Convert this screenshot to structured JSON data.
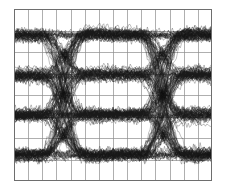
{
  "figure": {
    "width": 228,
    "height": 192,
    "background_color": "#ffffff"
  },
  "plot_area": {
    "left": 14,
    "top": 9,
    "width": 198,
    "height": 172,
    "background_color": "#ffffff",
    "border_color": "#6e6e6e",
    "border_width": 1
  },
  "chart_data": {
    "type": "line",
    "subtype": "eye-diagram",
    "title": "",
    "subtitle": "",
    "xlabel": "",
    "ylabel": "",
    "modulation": "PAM-4",
    "level_count": 4,
    "eye_count_vertical": 3,
    "unit_intervals_shown": 2,
    "xlim": [
      0,
      2
    ],
    "ylim": [
      -0.22,
      1.22
    ],
    "x_tick_labels": [],
    "y_tick_labels": [],
    "grid": {
      "visible": true,
      "color": "#8c8c8c",
      "line_width": 0.7,
      "vertical_divisions": 14,
      "horizontal_divisions": 8
    },
    "signal_levels": {
      "normalized": [
        0,
        0.3333,
        0.6667,
        1
      ],
      "pixel_y": [
        157,
        113,
        73,
        33
      ]
    },
    "crossing_points_x_pixel": [
      75,
      178
    ],
    "crossing_points_x_ui": [
      0.5,
      1.5
    ],
    "trace": {
      "color": "#1a1a1a",
      "line_width": 0.55,
      "opacity": 0.5,
      "sweep_count": 230,
      "samples_per_sweep": 150,
      "persistence": true
    },
    "impairments": {
      "jitter_rms_ui": 0.026,
      "amplitude_noise_rms": 0.016,
      "rise_time_ui": 0.42,
      "rise_time_spread_ui": 0.1,
      "overshoot": 0.035,
      "level_spread": 0.022
    },
    "series": [
      {
        "name": "transition-0-to-0",
        "from_level": 0,
        "to_level": 0
      },
      {
        "name": "transition-0-to-1",
        "from_level": 0,
        "to_level": 1
      },
      {
        "name": "transition-0-to-2",
        "from_level": 0,
        "to_level": 2
      },
      {
        "name": "transition-0-to-3",
        "from_level": 0,
        "to_level": 3
      },
      {
        "name": "transition-1-to-0",
        "from_level": 1,
        "to_level": 0
      },
      {
        "name": "transition-1-to-1",
        "from_level": 1,
        "to_level": 1
      },
      {
        "name": "transition-1-to-2",
        "from_level": 1,
        "to_level": 2
      },
      {
        "name": "transition-1-to-3",
        "from_level": 1,
        "to_level": 3
      },
      {
        "name": "transition-2-to-0",
        "from_level": 2,
        "to_level": 0
      },
      {
        "name": "transition-2-to-1",
        "from_level": 2,
        "to_level": 1
      },
      {
        "name": "transition-2-to-2",
        "from_level": 2,
        "to_level": 2
      },
      {
        "name": "transition-2-to-3",
        "from_level": 2,
        "to_level": 3
      },
      {
        "name": "transition-3-to-0",
        "from_level": 3,
        "to_level": 0
      },
      {
        "name": "transition-3-to-1",
        "from_level": 3,
        "to_level": 1
      },
      {
        "name": "transition-3-to-2",
        "from_level": 3,
        "to_level": 2
      },
      {
        "name": "transition-3-to-3",
        "from_level": 3,
        "to_level": 3
      }
    ],
    "legend": {
      "visible": false,
      "position": "none",
      "entries": []
    },
    "annotations": []
  }
}
